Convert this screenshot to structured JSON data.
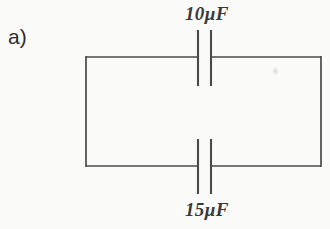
{
  "figure": {
    "part_label": "a)",
    "type": "circuit-diagram",
    "background_color": "#fbfbfa",
    "line_color": "#4a4a4a",
    "text_color": "#3a3a3a"
  },
  "circuit": {
    "loop": {
      "left": 86,
      "top": 57,
      "right": 321,
      "bottom": 166
    },
    "components": [
      {
        "id": "capacitor-top",
        "label": "10µF",
        "value": 10,
        "unit": "µF",
        "branch": "top",
        "plate_left_x": 198,
        "plate_right_x": 211,
        "plate_top_y": 30,
        "plate_bottom_y": 86
      },
      {
        "id": "capacitor-bottom",
        "label": "15µF",
        "value": 15,
        "unit": "µF",
        "branch": "bottom",
        "plate_left_x": 198,
        "plate_right_x": 211,
        "plate_top_y": 139,
        "plate_bottom_y": 194
      }
    ]
  }
}
